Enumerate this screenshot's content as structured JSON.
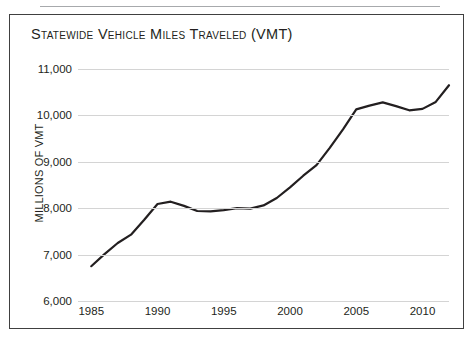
{
  "figure": {
    "title": "Statewide Vehicle Miles Traveled (VMT)",
    "frame_color": "#404040",
    "rule_color": "#a7a9ac",
    "background": "#ffffff"
  },
  "chart_data": {
    "type": "line",
    "title": "Statewide Vehicle Miles Traveled (VMT)",
    "xlabel": "",
    "ylabel": "MILLIONS OF VMT",
    "xlim": [
      1984,
      2012
    ],
    "ylim": [
      6000,
      11000
    ],
    "grid": true,
    "legend": false,
    "line_color": "#231f20",
    "line_width": 2.2,
    "grid_color": "#d4d4d4",
    "ytick_labels": [
      "11,000",
      "10,000",
      "9,000",
      "8,000",
      "7,000",
      "6,000"
    ],
    "ytick_values": [
      11000,
      10000,
      9000,
      8000,
      7000,
      6000
    ],
    "xtick_labels": [
      "1985",
      "1990",
      "1995",
      "2000",
      "2005",
      "2010"
    ],
    "xtick_values": [
      1985,
      1990,
      1995,
      2000,
      2005,
      2010
    ],
    "x": [
      1985,
      1986,
      1987,
      1988,
      1989,
      1990,
      1991,
      1992,
      1993,
      1994,
      1995,
      1996,
      1997,
      1998,
      1999,
      2000,
      2001,
      2002,
      2003,
      2004,
      2005,
      2006,
      2007,
      2008,
      2009,
      2010,
      2011,
      2012
    ],
    "series": [
      {
        "name": "Statewide VMT",
        "values": [
          6750,
          7010,
          7250,
          7430,
          7750,
          8090,
          8140,
          8050,
          7940,
          7930,
          7960,
          8000,
          7990,
          8060,
          8220,
          8450,
          8700,
          8930,
          9300,
          9700,
          10130,
          10210,
          10280,
          10200,
          10110,
          10140,
          10290,
          10650
        ]
      }
    ]
  }
}
